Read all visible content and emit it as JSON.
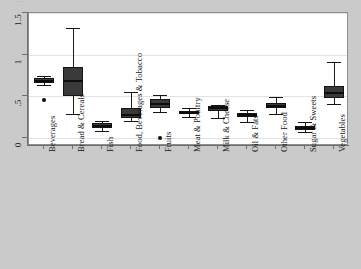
{
  "figure": {
    "background_color": "#cacaca",
    "panel_color": "#ffffff",
    "box_fill": "#3a3a3a",
    "grid_color": "#e2e2e2",
    "top_sliver_text": "......"
  },
  "chart_data": {
    "type": "box",
    "title": "",
    "xlabel": "",
    "ylabel": "",
    "ylim": [
      0,
      1.5
    ],
    "yticks": [
      0,
      0.5,
      1,
      1.5
    ],
    "ytick_labels": [
      "0",
      ".5",
      "1",
      "1.5"
    ],
    "grid": true,
    "legend": "none",
    "categories": [
      "Beverages",
      "Bread & Cereals",
      "Fish",
      "Food, Beverages & Tobacco",
      "Fruits",
      "Meat & Poultry",
      "Milk & Cheese",
      "Oil & Fats",
      "Other Food",
      "Sugar & Sweets",
      "Vegetables"
    ],
    "boxes": [
      {
        "category": "Beverages",
        "whisker_low": 0.64,
        "q1": 0.655,
        "median": 0.685,
        "q3": 0.715,
        "whisker_high": 0.745,
        "outliers": [
          0.46
        ]
      },
      {
        "category": "Bread & Cereals",
        "whisker_low": 0.29,
        "q1": 0.5,
        "median": 0.69,
        "q3": 0.85,
        "whisker_high": 1.32,
        "outliers": []
      },
      {
        "category": "Fish",
        "whisker_low": 0.08,
        "q1": 0.125,
        "median": 0.145,
        "q3": 0.175,
        "whisker_high": 0.21,
        "outliers": []
      },
      {
        "category": "Food, Beverages & Tobacco",
        "whisker_low": 0.2,
        "q1": 0.245,
        "median": 0.275,
        "q3": 0.355,
        "whisker_high": 0.555,
        "outliers": []
      },
      {
        "category": "Fruits",
        "whisker_low": 0.315,
        "q1": 0.355,
        "median": 0.41,
        "q3": 0.465,
        "whisker_high": 0.52,
        "outliers": [
          0.005
        ]
      },
      {
        "category": "Meat & Poultry",
        "whisker_low": 0.255,
        "q1": 0.29,
        "median": 0.305,
        "q3": 0.325,
        "whisker_high": 0.36,
        "outliers": []
      },
      {
        "category": "Milk & Cheese",
        "whisker_low": 0.235,
        "q1": 0.325,
        "median": 0.355,
        "q3": 0.38,
        "whisker_high": 0.4,
        "outliers": []
      },
      {
        "category": "Oil & Fats",
        "whisker_low": 0.195,
        "q1": 0.25,
        "median": 0.275,
        "q3": 0.3,
        "whisker_high": 0.335,
        "outliers": []
      },
      {
        "category": "Other Food",
        "whisker_low": 0.285,
        "q1": 0.355,
        "median": 0.385,
        "q3": 0.425,
        "whisker_high": 0.495,
        "outliers": []
      },
      {
        "category": "Sugar & Sweets",
        "whisker_low": 0.075,
        "q1": 0.1,
        "median": 0.12,
        "q3": 0.145,
        "whisker_high": 0.195,
        "outliers": []
      },
      {
        "category": "Vegetables",
        "whisker_low": 0.405,
        "q1": 0.485,
        "median": 0.545,
        "q3": 0.63,
        "whisker_high": 0.915,
        "outliers": []
      }
    ]
  }
}
